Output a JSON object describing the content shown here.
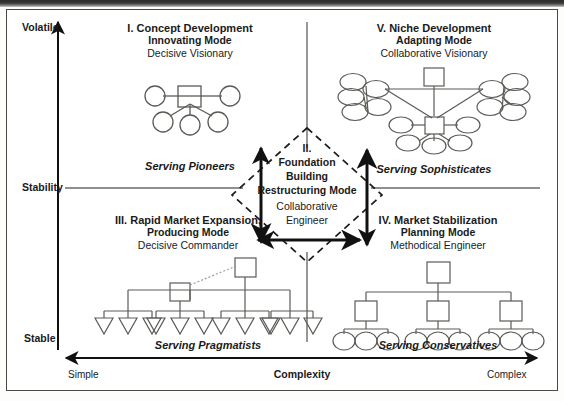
{
  "diagram": {
    "title_hidden": "",
    "axes": {
      "y_label": "Stability",
      "y_top": "Volatile",
      "y_bottom": "Stable",
      "x_label": "Complexity",
      "x_left": "Simple",
      "x_right": "Complex"
    },
    "quadrants": [
      {
        "id": "I",
        "title": "I. Concept Development",
        "mode": "Innovating Mode",
        "role": "Decisive Visionary",
        "serving": "Serving Pioneers",
        "org_shape": "hub-and-spoke-circles"
      },
      {
        "id": "V",
        "title": "V. Niche Development",
        "mode": "Adapting Mode",
        "role": "Collaborative Visionary",
        "serving": "Serving Sophisticates",
        "org_shape": "network-of-clusters"
      },
      {
        "id": "III",
        "title": "III. Rapid Market Expansion,",
        "mode": "Producing Mode",
        "role": "Decisive Commander",
        "serving": "Serving Pragmatists",
        "org_shape": "flat-hierarchy-triangles"
      },
      {
        "id": "IV",
        "title": "IV. Market Stabilization",
        "mode": "Planning Mode",
        "role": "Methodical Engineer",
        "serving": "Serving Conservatives",
        "org_shape": "three-level-hierarchy-circles"
      }
    ],
    "center": {
      "id": "II.",
      "line1": "Foundation",
      "line2": "Building",
      "line3": "Restructuring Mode",
      "role": "Collaborative Engineer"
    },
    "colors": {
      "ink": "#1a1a1a",
      "line": "#5a5a56",
      "frame": "#4a4a46",
      "paper": "#ffffff"
    }
  }
}
